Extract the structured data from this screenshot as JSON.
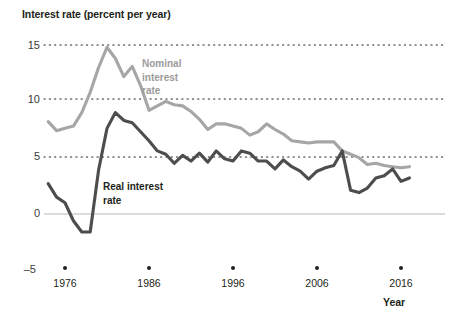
{
  "chart_data": {
    "type": "line",
    "title": "Interest rate (percent per year)",
    "xlabel": "Year",
    "ylabel": "Interest rate (percent per year)",
    "xlim": [
      1974,
      2018
    ],
    "ylim": [
      -5,
      15
    ],
    "yticks": [
      15,
      10,
      5,
      0,
      -5
    ],
    "ytick_labels": [
      "15",
      "10",
      "5",
      "0",
      "–5"
    ],
    "xticks": [
      1976,
      1986,
      1996,
      2006,
      2016
    ],
    "xtick_labels": [
      "1976",
      "1986",
      "1996",
      "2006",
      "2016"
    ],
    "grid": "horizontal dotted at 15, 10, 5; solid light line at 0",
    "legend_position": "inline annotations on plot",
    "x": [
      1974,
      1975,
      1976,
      1977,
      1978,
      1979,
      1980,
      1981,
      1982,
      1983,
      1984,
      1985,
      1986,
      1987,
      1988,
      1989,
      1990,
      1991,
      1992,
      1993,
      1994,
      1995,
      1996,
      1997,
      1998,
      1999,
      2000,
      2001,
      2002,
      2003,
      2004,
      2005,
      2006,
      2007,
      2008,
      2009,
      2010,
      2011,
      2012,
      2013,
      2014,
      2015,
      2016,
      2017
    ],
    "series": [
      {
        "name": "Nominal interest rate",
        "color": "#a6a6a6",
        "label_lines": [
          "Nominal",
          "interest",
          "rate"
        ],
        "values": [
          8.2,
          7.4,
          7.6,
          7.8,
          9.0,
          10.8,
          13.0,
          14.8,
          13.8,
          12.2,
          13.1,
          11.4,
          9.2,
          9.6,
          10.0,
          9.7,
          9.6,
          9.1,
          8.4,
          7.5,
          8.0,
          8.0,
          7.8,
          7.6,
          7.0,
          7.3,
          8.0,
          7.5,
          7.1,
          6.5,
          6.4,
          6.3,
          6.4,
          6.4,
          6.4,
          5.6,
          5.3,
          5.0,
          4.4,
          4.5,
          4.3,
          4.2,
          4.1,
          4.2
        ]
      },
      {
        "name": "Real interest rate",
        "color": "#4d4d4d",
        "label_lines": [
          "Real interest",
          "rate"
        ],
        "values": [
          2.7,
          1.5,
          1.0,
          -0.6,
          -1.6,
          -1.6,
          3.9,
          7.6,
          9.0,
          8.3,
          8.1,
          7.3,
          6.5,
          5.6,
          5.3,
          4.5,
          5.2,
          4.7,
          5.4,
          4.6,
          5.6,
          4.9,
          4.7,
          5.6,
          5.4,
          4.7,
          4.7,
          4.0,
          4.8,
          4.2,
          3.8,
          3.1,
          3.8,
          4.1,
          4.3,
          5.6,
          2.1,
          1.9,
          2.3,
          3.2,
          3.4,
          4.0,
          2.9,
          3.2
        ]
      }
    ]
  }
}
